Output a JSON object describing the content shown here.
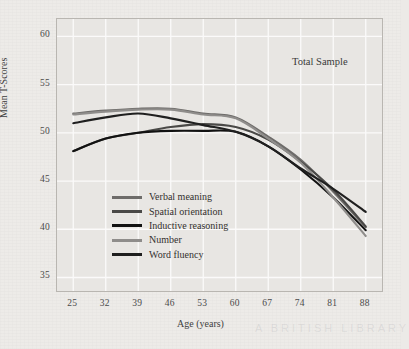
{
  "chart_data": {
    "type": "line",
    "title": "",
    "annotation": "Total Sample",
    "xlabel": "Age (years)",
    "ylabel": "Mean T-Scores",
    "x": [
      25,
      32,
      39,
      46,
      53,
      60,
      67,
      74,
      81,
      88
    ],
    "xticks": [
      "25",
      "32",
      "39",
      "46",
      "53",
      "60",
      "67",
      "74",
      "81",
      "88"
    ],
    "yticks": [
      "35",
      "40",
      "45",
      "50",
      "55",
      "60"
    ],
    "xlim": [
      21.5,
      91.5
    ],
    "ylim": [
      33.6,
      61.8
    ],
    "grid": true,
    "legend_position": "inside-lower-left",
    "series": [
      {
        "name": "Verbal meaning",
        "color": "#6e6c6a",
        "values": [
          52.0,
          52.3,
          52.5,
          52.5,
          52.0,
          51.6,
          49.6,
          47.2,
          43.9,
          40.2
        ]
      },
      {
        "name": "Spatial orientation",
        "color": "#4a4947",
        "values": [
          48.1,
          49.4,
          50.0,
          50.6,
          50.9,
          50.6,
          49.3,
          47.0,
          44.1,
          40.3
        ]
      },
      {
        "name": "Inductive reasoning",
        "color": "#121212",
        "values": [
          48.1,
          49.4,
          50.0,
          50.2,
          50.2,
          50.1,
          48.6,
          46.2,
          43.3,
          39.9
        ]
      },
      {
        "name": "Number",
        "color": "#8f8d8b",
        "values": [
          51.9,
          52.2,
          52.4,
          52.4,
          51.9,
          51.5,
          49.4,
          46.9,
          43.3,
          39.3
        ]
      },
      {
        "name": "Word fluency",
        "color": "#1f1f1f",
        "values": [
          51.0,
          51.6,
          52.0,
          51.5,
          50.8,
          50.1,
          48.6,
          46.3,
          44.2,
          41.8
        ]
      }
    ]
  },
  "watermark": "A BRITISH LIBRARY"
}
